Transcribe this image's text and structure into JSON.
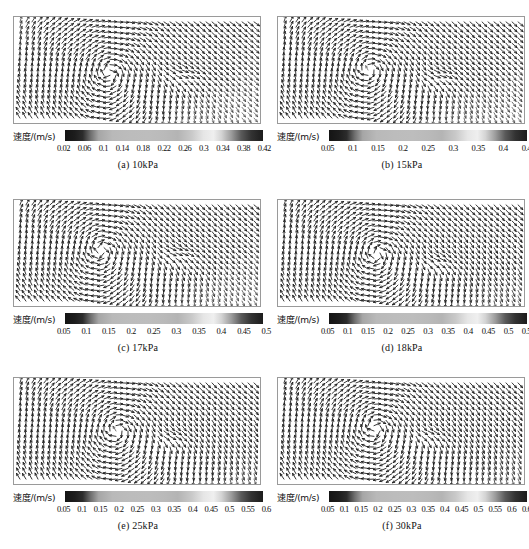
{
  "figure": {
    "axis_label": "速度/(m/s)",
    "panels": [
      {
        "id": "a",
        "caption": "(a) 10kPa",
        "colorbar_label": "速度/(m/s)",
        "ticks": [
          "0.02",
          "0.06",
          "0.1",
          "0.14",
          "0.18",
          "0.22",
          "0.26",
          "0.3",
          "0.34",
          "0.38",
          "0.42"
        ]
      },
      {
        "id": "b",
        "caption": "(b) 15kPa",
        "colorbar_label": "速度/(m/s)",
        "ticks": [
          "0.05",
          "0.1",
          "0.15",
          "0.2",
          "0.25",
          "0.3",
          "0.35",
          "0.4",
          "0.45"
        ]
      },
      {
        "id": "c",
        "caption": "(c) 17kPa",
        "colorbar_label": "速度/(m/s)",
        "ticks": [
          "0.05",
          "0.1",
          "0.15",
          "0.2",
          "0.25",
          "0.3",
          "0.35",
          "0.4",
          "0.45",
          "0.5"
        ]
      },
      {
        "id": "d",
        "caption": "(d) 18kPa",
        "colorbar_label": "速度/(m/s)",
        "ticks": [
          "0.05",
          "0.1",
          "0.15",
          "0.2",
          "0.25",
          "0.3",
          "0.35",
          "0.4",
          "0.45",
          "0.5",
          "0.55"
        ]
      },
      {
        "id": "e",
        "caption": "(e) 25kPa",
        "colorbar_label": "速度/(m/s)",
        "ticks": [
          "0.05",
          "0.1",
          "0.15",
          "0.2",
          "0.25",
          "0.3",
          "0.35",
          "0.4",
          "0.45",
          "0.5",
          "0.55",
          "0.6"
        ]
      },
      {
        "id": "f",
        "caption": "(f) 30kPa",
        "colorbar_label": "速度/(m/s)",
        "ticks": [
          "0.05",
          "0.1",
          "0.15",
          "0.2",
          "0.25",
          "0.3",
          "0.35",
          "0.4",
          "0.45",
          "0.5",
          "0.55",
          "0.6",
          "0.65"
        ]
      }
    ]
  },
  "chart_data": {
    "type": "heatmap",
    "title": "",
    "xlabel": "",
    "ylabel": "",
    "colormap": "grayscale-jet",
    "panels": [
      {
        "id": "a",
        "label": "(a) 10kPa",
        "pressure_kPa": 10,
        "unit": "m/s",
        "colorbar_ticks": [
          0.02,
          0.06,
          0.1,
          0.14,
          0.18,
          0.22,
          0.26,
          0.3,
          0.34,
          0.38,
          0.42
        ],
        "clim": [
          0.02,
          0.42
        ]
      },
      {
        "id": "b",
        "label": "(b) 15kPa",
        "pressure_kPa": 15,
        "unit": "m/s",
        "colorbar_ticks": [
          0.05,
          0.1,
          0.15,
          0.2,
          0.25,
          0.3,
          0.35,
          0.4,
          0.45
        ],
        "clim": [
          0.05,
          0.45
        ]
      },
      {
        "id": "c",
        "label": "(c) 17kPa",
        "pressure_kPa": 17,
        "unit": "m/s",
        "colorbar_ticks": [
          0.05,
          0.1,
          0.15,
          0.2,
          0.25,
          0.3,
          0.35,
          0.4,
          0.45,
          0.5
        ],
        "clim": [
          0.05,
          0.5
        ]
      },
      {
        "id": "d",
        "label": "(d) 18kPa",
        "pressure_kPa": 18,
        "unit": "m/s",
        "colorbar_ticks": [
          0.05,
          0.1,
          0.15,
          0.2,
          0.25,
          0.3,
          0.35,
          0.4,
          0.45,
          0.5,
          0.55
        ],
        "clim": [
          0.05,
          0.55
        ]
      },
      {
        "id": "e",
        "label": "(e) 25kPa",
        "pressure_kPa": 25,
        "unit": "m/s",
        "colorbar_ticks": [
          0.05,
          0.1,
          0.15,
          0.2,
          0.25,
          0.3,
          0.35,
          0.4,
          0.45,
          0.5,
          0.55,
          0.6
        ],
        "clim": [
          0.05,
          0.6
        ]
      },
      {
        "id": "f",
        "label": "(f) 30kPa",
        "pressure_kPa": 30,
        "unit": "m/s",
        "colorbar_ticks": [
          0.05,
          0.1,
          0.15,
          0.2,
          0.25,
          0.3,
          0.35,
          0.4,
          0.45,
          0.5,
          0.55,
          0.6,
          0.65
        ],
        "clim": [
          0.05,
          0.65
        ]
      }
    ]
  }
}
